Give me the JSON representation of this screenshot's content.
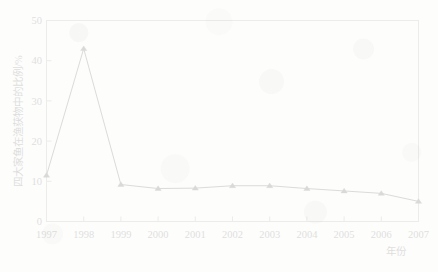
{
  "chart_data": {
    "type": "line",
    "title": "",
    "subtitle": "",
    "xlabel": "年份",
    "ylabel": "四大家鱼在渔获物中的比例/%",
    "x": [
      1997,
      1998,
      1999,
      2000,
      2001,
      2002,
      2003,
      2004,
      2005,
      2006,
      2007
    ],
    "categories": [
      "1997",
      "1998",
      "1999",
      "2000",
      "2001",
      "2002",
      "2003",
      "2004",
      "2005",
      "2006",
      "2007"
    ],
    "values": [
      11.5,
      43.0,
      9.2,
      8.2,
      8.3,
      8.9,
      8.9,
      8.2,
      7.6,
      7.0,
      5.0
    ],
    "series": [
      {
        "name": "四大家鱼在渔获物中的比例",
        "values": [
          11.5,
          43.0,
          9.2,
          8.2,
          8.3,
          8.9,
          8.9,
          8.2,
          7.6,
          7.0,
          5.0
        ]
      }
    ],
    "xlim": [
      1997,
      2007
    ],
    "ylim": [
      0,
      50
    ],
    "xticks": [
      "1997",
      "1998",
      "1999",
      "2000",
      "2001",
      "2002",
      "2003",
      "2004",
      "2005",
      "2006",
      "2007"
    ],
    "yticks": [
      "0",
      "10",
      "20",
      "30",
      "40",
      "50"
    ],
    "ytick_values": [
      0,
      10,
      20,
      30,
      40,
      50
    ],
    "grid": false,
    "legend": null,
    "legend_position": "none",
    "marker": "triangle",
    "line_color": "#1a1a1a",
    "marker_color": "#111111",
    "frame_color": "#8d8d8d",
    "background_color": "#fdfdfc",
    "annotations": []
  }
}
